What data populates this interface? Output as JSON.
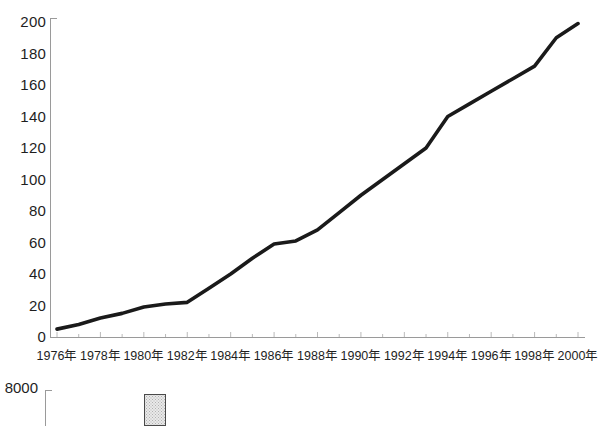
{
  "chart_data": [
    {
      "type": "line",
      "title": "",
      "subtitle": "",
      "xlabel": "",
      "ylabel": "",
      "grid": false,
      "legend": "none",
      "xlim": [
        1976,
        2000
      ],
      "ylim": [
        0,
        200
      ],
      "ytick_labels": [
        "0",
        "20",
        "40",
        "60",
        "80",
        "100",
        "120",
        "140",
        "160",
        "180",
        "200"
      ],
      "ytick_values": [
        0,
        20,
        40,
        60,
        80,
        100,
        120,
        140,
        160,
        180,
        200
      ],
      "xtick_labels": [
        "1976年",
        "1978年",
        "1980年",
        "1982年",
        "1984年",
        "1986年",
        "1988年",
        "1990年",
        "1992年",
        "1994年",
        "1996年",
        "1998年",
        "2000年"
      ],
      "xtick_values": [
        1976,
        1978,
        1980,
        1982,
        1984,
        1986,
        1988,
        1990,
        1992,
        1994,
        1996,
        1998,
        2000
      ],
      "series": [
        {
          "name": "series-1",
          "color": "#1a1a1a",
          "x": [
            1976,
            1977,
            1978,
            1979,
            1980,
            1981,
            1982,
            1983,
            1984,
            1985,
            1986,
            1987,
            1988,
            1989,
            1990,
            1991,
            1992,
            1993,
            1994,
            1995,
            1996,
            1997,
            1998,
            1999,
            2000
          ],
          "values": [
            5,
            8,
            12,
            15,
            19,
            21,
            22,
            31,
            40,
            50,
            59,
            61,
            68,
            79,
            90,
            100,
            110,
            120,
            140,
            148,
            156,
            164,
            172,
            190,
            199
          ]
        }
      ]
    },
    {
      "type": "bar",
      "title": "",
      "xlabel": "",
      "ylabel": "",
      "grid": false,
      "legend": "none",
      "ytick_labels": [
        "8000"
      ],
      "ytick_values": [
        8000
      ],
      "categories": [
        "bar-1"
      ],
      "values": [
        8000
      ],
      "bar_color": "#e9e9e9",
      "bar_border_color": "#4a4a4a",
      "note": "second chart is cropped at the bottom edge of the screenshot; only the 8000 axis label, the axis line and one stippled bar are visible"
    }
  ],
  "axes": {
    "main": {
      "y_ticks": [
        "200",
        "180",
        "160",
        "140",
        "120",
        "100",
        "80",
        "60",
        "40",
        "20",
        "0"
      ],
      "x_ticks": [
        "1976年",
        "1978年",
        "1980年",
        "1982年",
        "1984年",
        "1986年",
        "1988年",
        "1990年",
        "1992年",
        "1994年",
        "1996年",
        "1998年",
        "2000年"
      ],
      "axis_color": "#9a9a9a",
      "line_color": "#1a1a1a"
    },
    "secondary": {
      "y_top_label": "8000",
      "axis_color": "#9a9a9a"
    }
  },
  "colors": {
    "background": "#ffffff",
    "text": "#1e1e1e",
    "data_line": "#1a1a1a",
    "axis": "#9a9a9a",
    "bar_fill": "#e9e9e9",
    "bar_stroke": "#4a4a4a"
  }
}
